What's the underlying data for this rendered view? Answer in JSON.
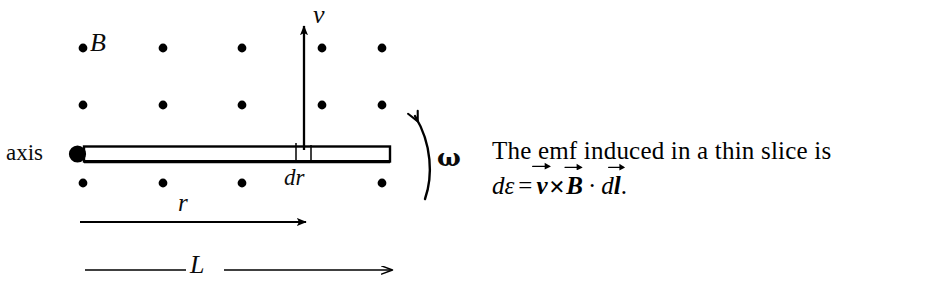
{
  "figure": {
    "type": "physics-diagram",
    "labels": {
      "axis": "axis",
      "field": "B",
      "velocity": "v",
      "slice": "dr",
      "radius": "r",
      "length": "L",
      "angular_velocity": "ω"
    },
    "field_dots": {
      "symbol_meaning": "magnetic-field-out-of-page",
      "rows": 3,
      "columns": 5,
      "row_y": [
        48,
        105,
        183
      ],
      "column_x": [
        83,
        163,
        242,
        322,
        382
      ],
      "hidden": [
        [
          2,
          3
        ]
      ],
      "radius": 4.2,
      "color": "#000000"
    },
    "rod": {
      "left_x": 84,
      "right_x": 390,
      "top_y": 146,
      "bottom_y": 162,
      "pivot_x": 77,
      "pivot_y": 154,
      "pivot_radius": 8.5,
      "slice_x1": 296,
      "slice_x2": 311,
      "color": "#000000"
    },
    "velocity_arrow": {
      "x": 304,
      "y_tail": 150,
      "y_head": 24
    },
    "omega_arc": {
      "description": "counter-clockwise rotation arc at right end of rod",
      "arrow_direction": "up-left"
    },
    "r_arrow": {
      "x_tail": 80,
      "x_head": 307,
      "y": 222
    },
    "L_arrow": {
      "x_tail": 85,
      "x_head": 392,
      "y": 270,
      "label_gap_x1": 186,
      "label_gap_x2": 224
    }
  },
  "caption": {
    "line1": "The emf induced in a thin slice is",
    "formula": {
      "plain": "dε = v⃗ ✕ B⃗ · dl⃗.",
      "d1": "d",
      "epsilon": "ε",
      "equals": "=",
      "v": "v",
      "cross": "✕",
      "B": "B",
      "dot": "·",
      "d2": "d",
      "l": "l",
      "period": "."
    }
  },
  "colors": {
    "ink": "#000000",
    "background": "#ffffff"
  }
}
